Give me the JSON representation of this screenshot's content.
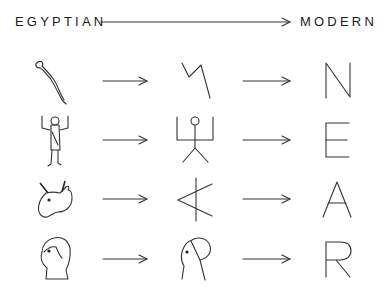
{
  "header": {
    "left_label": "EGYPTIAN",
    "right_label": "MODERN",
    "direction": "arrow-right"
  },
  "rows": [
    {
      "egyptian": "snake-hieroglyph",
      "intermediate": "zigzag-glyph",
      "modern": "N"
    },
    {
      "egyptian": "man-with-raised-arms-hieroglyph",
      "intermediate": "stick-figure-glyph",
      "modern": "E"
    },
    {
      "egyptian": "ox-head-hieroglyph",
      "intermediate": "rotated-ox-glyph",
      "modern": "A"
    },
    {
      "egyptian": "human-head-hieroglyph",
      "intermediate": "head-outline-glyph",
      "modern": "R"
    }
  ]
}
